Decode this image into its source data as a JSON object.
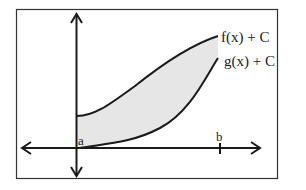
{
  "diagram": {
    "title": "",
    "colors": {
      "stroke": "#1a1a1a",
      "frame": "#333333",
      "fill": "#e6e6e6",
      "background": "#ffffff"
    },
    "curves": {
      "upper": {
        "label": "f(x) + C"
      },
      "lower": {
        "label": "g(x) + C"
      }
    },
    "x_axis": {
      "points": [
        {
          "name": "a",
          "label": "a"
        },
        {
          "name": "b",
          "label": "b"
        }
      ]
    },
    "shaded_region": "area between f(x)+C and g(x)+C from a to b"
  }
}
